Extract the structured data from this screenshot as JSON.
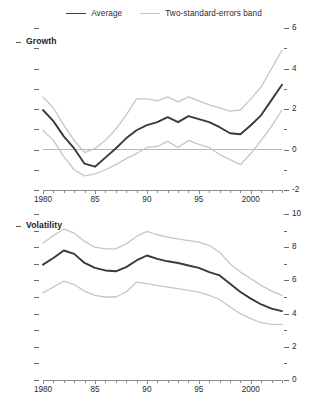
{
  "legend": {
    "items": [
      {
        "label": "Average",
        "style": "solid-dark",
        "color": "#3a3a3a"
      },
      {
        "label": "Two-standard-errors band",
        "style": "solid-light",
        "color": "#c6c6c6"
      }
    ]
  },
  "chart_data": [
    {
      "type": "line",
      "title": "Growth",
      "xlabel": "",
      "ylabel": "",
      "xlim": [
        1980,
        2003
      ],
      "ylim": [
        -2,
        6
      ],
      "grid": false,
      "zero_line": 0,
      "legend_position": "top-center",
      "x": [
        1980,
        1981,
        1982,
        1983,
        1984,
        1985,
        1986,
        1987,
        1988,
        1989,
        1990,
        1991,
        1992,
        1993,
        1994,
        1995,
        1996,
        1997,
        1998,
        1999,
        2000,
        2001,
        2002,
        2003
      ],
      "xticks": [
        1980,
        1985,
        1990,
        1995,
        2000
      ],
      "xticklabels": [
        "1980",
        "85",
        "90",
        "95",
        "2000"
      ],
      "yticks": [
        -2,
        0,
        2,
        4,
        6
      ],
      "yticklabels": [
        "-2",
        "0",
        "2",
        "4",
        "6"
      ],
      "yminorticks": [
        -1,
        1,
        3,
        5
      ],
      "series": [
        {
          "name": "Average",
          "color": "#3a3a3a",
          "values": [
            1.95,
            1.4,
            0.65,
            0.05,
            -0.7,
            -0.85,
            -0.4,
            0.05,
            0.55,
            0.95,
            1.2,
            1.35,
            1.6,
            1.35,
            1.65,
            1.5,
            1.35,
            1.1,
            0.8,
            0.75,
            1.2,
            1.7,
            2.45,
            3.2
          ]
        },
        {
          "name": "Upper two-standard-errors band",
          "color": "#c6c6c6",
          "values": [
            2.6,
            2.05,
            1.2,
            0.45,
            -0.15,
            0.05,
            0.45,
            1.0,
            1.7,
            2.5,
            2.5,
            2.4,
            2.6,
            2.35,
            2.6,
            2.4,
            2.2,
            2.05,
            1.9,
            1.95,
            2.5,
            3.1,
            4.0,
            4.9
          ]
        },
        {
          "name": "Lower two-standard-errors band",
          "color": "#c6c6c6",
          "values": [
            0.95,
            0.45,
            -0.35,
            -1.0,
            -1.3,
            -1.2,
            -1.0,
            -0.75,
            -0.45,
            -0.2,
            0.1,
            0.15,
            0.4,
            0.1,
            0.45,
            0.25,
            0.1,
            -0.25,
            -0.5,
            -0.75,
            -0.2,
            0.45,
            1.15,
            1.95
          ]
        }
      ]
    },
    {
      "type": "line",
      "title": "Volatility",
      "xlabel": "",
      "ylabel": "",
      "xlim": [
        1980,
        2003
      ],
      "ylim": [
        0,
        10
      ],
      "grid": false,
      "legend_position": "top-center",
      "x": [
        1980,
        1981,
        1982,
        1983,
        1984,
        1985,
        1986,
        1987,
        1988,
        1989,
        1990,
        1991,
        1992,
        1993,
        1994,
        1995,
        1996,
        1997,
        1998,
        1999,
        2000,
        2001,
        2002,
        2003
      ],
      "xticks": [
        1980,
        1985,
        1990,
        1995,
        2000
      ],
      "xticklabels": [
        "1980",
        "85",
        "90",
        "95",
        "2000"
      ],
      "yticks": [
        0,
        2,
        4,
        6,
        8,
        10
      ],
      "yticklabels": [
        "0",
        "2",
        "4",
        "6",
        "8",
        "10"
      ],
      "yminorticks": [
        1,
        3,
        5,
        7,
        9
      ],
      "series": [
        {
          "name": "Average",
          "color": "#3a3a3a",
          "values": [
            6.95,
            7.35,
            7.8,
            7.6,
            7.05,
            6.75,
            6.6,
            6.55,
            6.8,
            7.2,
            7.5,
            7.3,
            7.15,
            7.05,
            6.9,
            6.75,
            6.5,
            6.3,
            5.8,
            5.3,
            4.9,
            4.55,
            4.3,
            4.15
          ]
        },
        {
          "name": "Upper two-standard-errors band",
          "color": "#c6c6c6",
          "values": [
            8.25,
            8.7,
            9.1,
            8.85,
            8.35,
            8.0,
            7.9,
            7.9,
            8.2,
            8.65,
            8.95,
            8.75,
            8.6,
            8.5,
            8.4,
            8.3,
            8.1,
            7.7,
            7.0,
            6.5,
            6.1,
            5.7,
            5.35,
            5.1
          ]
        },
        {
          "name": "Lower two-standard-errors band",
          "color": "#c6c6c6",
          "values": [
            5.25,
            5.6,
            5.95,
            5.75,
            5.35,
            5.1,
            5.0,
            5.0,
            5.3,
            5.9,
            5.8,
            5.7,
            5.6,
            5.5,
            5.4,
            5.3,
            5.1,
            4.85,
            4.4,
            4.0,
            3.7,
            3.45,
            3.35,
            3.35
          ]
        }
      ]
    }
  ]
}
